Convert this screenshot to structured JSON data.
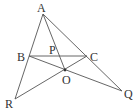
{
  "diagram": {
    "type": "geometry",
    "stroke_color": "#555555",
    "label_color": "#333333",
    "points": {
      "A": {
        "label": "A",
        "x": 43,
        "y": 14,
        "lx": 37,
        "ly": 12
      },
      "B": {
        "label": "B",
        "x": 29,
        "y": 56,
        "lx": 17,
        "ly": 61
      },
      "C": {
        "label": "C",
        "x": 87,
        "y": 56,
        "lx": 90,
        "ly": 61
      },
      "P": {
        "label": "P",
        "x": 55,
        "y": 56,
        "lx": 49,
        "ly": 54
      },
      "O": {
        "label": "O",
        "x": 65,
        "y": 70,
        "lx": 62,
        "ly": 84
      },
      "R": {
        "label": "R",
        "x": 15,
        "y": 99,
        "lx": 5,
        "ly": 108
      },
      "Q": {
        "label": "Q",
        "x": 122,
        "y": 91,
        "lx": 124,
        "ly": 98
      }
    },
    "segments": [
      [
        "A",
        "R"
      ],
      [
        "A",
        "Q"
      ],
      [
        "A",
        "O"
      ],
      [
        "B",
        "C"
      ],
      [
        "B",
        "Q"
      ],
      [
        "R",
        "C"
      ]
    ]
  }
}
